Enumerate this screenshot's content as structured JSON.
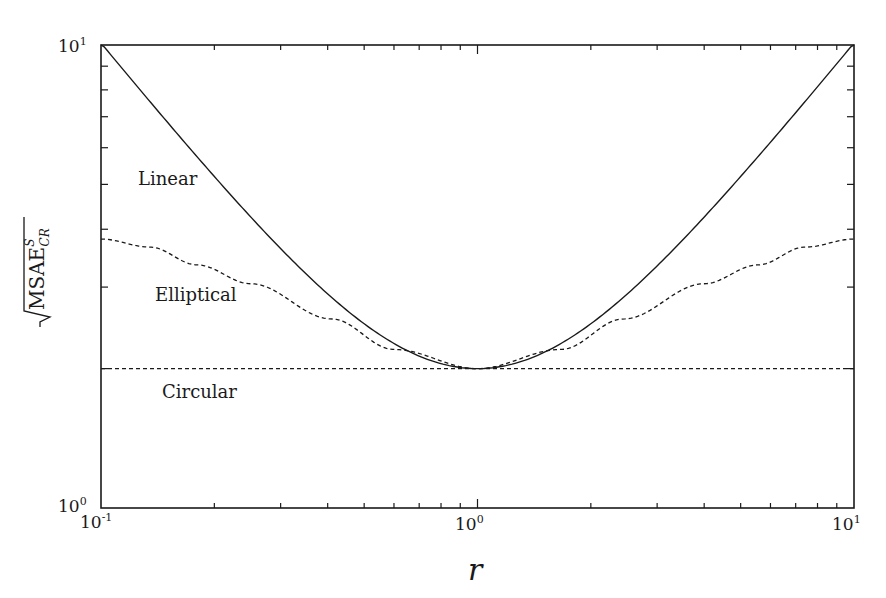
{
  "chart_data": {
    "type": "line",
    "title": "",
    "xlabel": "r",
    "ylabel": "√MSAE^S_CR",
    "xscale": "log",
    "yscale": "log",
    "xlim": [
      0.1,
      10
    ],
    "ylim": [
      1,
      10
    ],
    "x_tick_labels": [
      "10-1",
      "100",
      "101"
    ],
    "y_tick_labels": [
      "100",
      "101"
    ],
    "grid": false,
    "legend": "inline labels",
    "x": [
      0.1,
      0.135,
      0.18,
      0.25,
      0.41,
      0.6,
      1.0,
      1.667,
      2.44,
      4.0,
      5.56,
      7.41,
      10.0
    ],
    "series": [
      {
        "name": "Linear",
        "style": "solid",
        "values": [
          10.1,
          7.54,
          5.74,
          4.25,
          2.85,
          2.27,
          2.0,
          2.27,
          2.85,
          4.25,
          5.74,
          7.54,
          10.1
        ]
      },
      {
        "name": "Elliptical",
        "style": "dashed",
        "values": [
          3.81,
          3.66,
          3.35,
          3.05,
          2.56,
          2.2,
          2.0,
          2.2,
          2.56,
          3.05,
          3.35,
          3.66,
          3.81
        ]
      },
      {
        "name": "Circular",
        "style": "dashed",
        "values": [
          2.0,
          2.0,
          2.0,
          2.0,
          2.0,
          2.0,
          2.0,
          2.0,
          2.0,
          2.0,
          2.0,
          2.0,
          2.0
        ]
      }
    ],
    "annotations": [
      {
        "text": "Linear",
        "x": 0.17,
        "y": 5.9
      },
      {
        "text": "Elliptical",
        "x": 0.2,
        "y": 3.3
      },
      {
        "text": "Circular",
        "x": 0.2,
        "y": 1.73
      }
    ]
  },
  "labels": {
    "x_axis": "r",
    "y_axis_main": "MSAE",
    "y_axis_sup": "S",
    "y_axis_sub": "CR",
    "linear": "Linear",
    "elliptical": "Elliptical",
    "circular": "Circular",
    "xt0_base": "10",
    "xt0_exp": "-1",
    "xt1_base": "10",
    "xt1_exp": "0",
    "xt2_base": "10",
    "xt2_exp": "1",
    "yt0_base": "10",
    "yt0_exp": "0",
    "yt1_base": "10",
    "yt1_exp": "1"
  }
}
